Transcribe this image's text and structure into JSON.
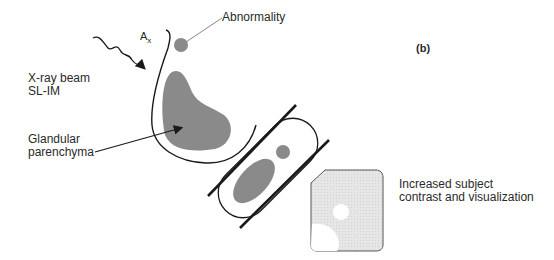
{
  "figure": {
    "panel_label": "(b)",
    "labels": {
      "ax": "A",
      "ax_sub": "x",
      "abnormality": "Abnormality",
      "xray_line1": "X-ray beam",
      "xray_line2": "SL-IM",
      "glandular_line1": "Glandular",
      "glandular_line2": "parenchyma",
      "result_line1": "Increased subject",
      "result_line2": "contrast and visualization"
    },
    "colors": {
      "tissue_fill": "#8a8a8a",
      "outline": "#1a1a1a",
      "image_bg": "#e6e6e6",
      "image_spot": "#ffffff",
      "leader_line": "#777777"
    }
  }
}
